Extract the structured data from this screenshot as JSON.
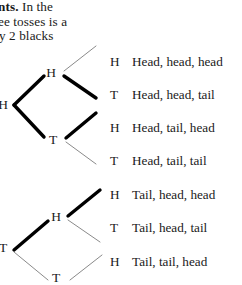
{
  "prose": {
    "lines": [
      {
        "bold": "nts.",
        "rest": " In the"
      },
      {
        "bold": "",
        "rest": "ee tosses is a"
      },
      {
        "bold": "",
        "rest": "y 2 blacks"
      }
    ],
    "line1_bold": "nts.",
    "line1_rest": "In the",
    "line2": "ee tosses is a",
    "line3": "y 2 blacks"
  },
  "tree": {
    "root": {
      "label": "H",
      "x": 2,
      "y": 105
    },
    "level2": [
      {
        "label": "H",
        "x": 50,
        "y": 73
      },
      {
        "label": "T",
        "x": 52,
        "y": 140
      }
    ],
    "level2_lower": [
      {
        "label": "H",
        "x": 55,
        "y": 217
      },
      {
        "label": "T",
        "x": 55,
        "y": 278
      }
    ],
    "root_lower": {
      "label": "T",
      "x": 2,
      "y": 248
    },
    "branch_styles": {
      "thin_color": "#8a8a8a",
      "thick_color": "#000000",
      "thin_width": 1.0,
      "thick_width": 3.4
    }
  },
  "outcomes": [
    {
      "toss": "H",
      "text": "Head, head, head",
      "y": 52
    },
    {
      "toss": "T",
      "text": "Head, head, tail",
      "y": 85
    },
    {
      "toss": "H",
      "text": "Head, tail, head",
      "y": 118
    },
    {
      "toss": "T",
      "text": "Head, tail, tail",
      "y": 151
    },
    {
      "toss": "H",
      "text": "Tail, head, head",
      "y": 185
    },
    {
      "toss": "T",
      "text": "Tail, head, tail",
      "y": 218
    },
    {
      "toss": "H",
      "text": "Tail, tail, head",
      "y": 252
    }
  ],
  "colors": {
    "background": "#ffffff",
    "text": "#1a1a1a",
    "branch_thick": "#000000",
    "branch_thin": "#8a8a8a"
  }
}
